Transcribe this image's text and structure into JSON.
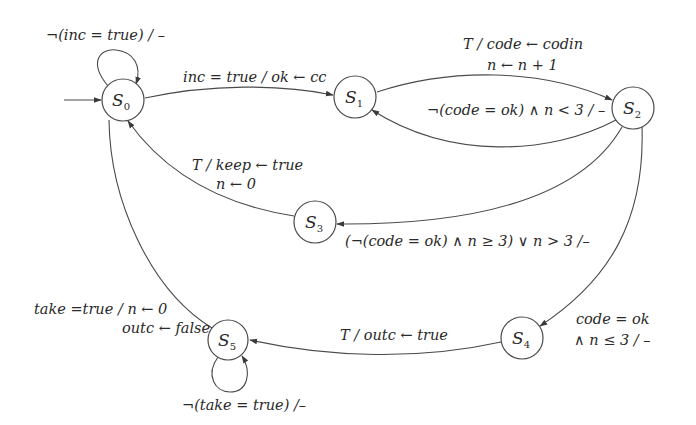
{
  "diagram": {
    "type": "state-machine",
    "initial_state": "S0",
    "states": [
      {
        "id": "S0",
        "name": "S",
        "sub": "0"
      },
      {
        "id": "S1",
        "name": "S",
        "sub": "1"
      },
      {
        "id": "S2",
        "name": "S",
        "sub": "2"
      },
      {
        "id": "S3",
        "name": "S",
        "sub": "3"
      },
      {
        "id": "S4",
        "name": "S",
        "sub": "4"
      },
      {
        "id": "S5",
        "name": "S",
        "sub": "5"
      }
    ],
    "transitions": [
      {
        "from": "S0",
        "to": "S0",
        "lines": [
          "¬(inc = true) / –"
        ]
      },
      {
        "from": "S0",
        "to": "S1",
        "lines": [
          "inc = true / ok ← cc"
        ]
      },
      {
        "from": "S1",
        "to": "S2",
        "lines": [
          "T / code ← codin",
          "n ← n + 1"
        ]
      },
      {
        "from": "S2",
        "to": "S1",
        "lines": [
          "¬(code = ok) ∧ n < 3 / –"
        ]
      },
      {
        "from": "S2",
        "to": "S3",
        "lines": [
          "(¬(code = ok) ∧ n ≥ 3) ∨ n > 3 /–"
        ]
      },
      {
        "from": "S3",
        "to": "S0",
        "lines": [
          "T / keep ← true",
          "n ← 0"
        ]
      },
      {
        "from": "S2",
        "to": "S4",
        "lines": [
          "code = ok",
          "∧  n ≤ 3 / –"
        ]
      },
      {
        "from": "S4",
        "to": "S5",
        "lines": [
          "T / outc ← true"
        ]
      },
      {
        "from": "S5",
        "to": "S0",
        "lines": [
          "take =true / n ← 0",
          "outc ← false"
        ]
      },
      {
        "from": "S5",
        "to": "S5",
        "lines": [
          "¬(take = true) /–"
        ]
      }
    ]
  }
}
